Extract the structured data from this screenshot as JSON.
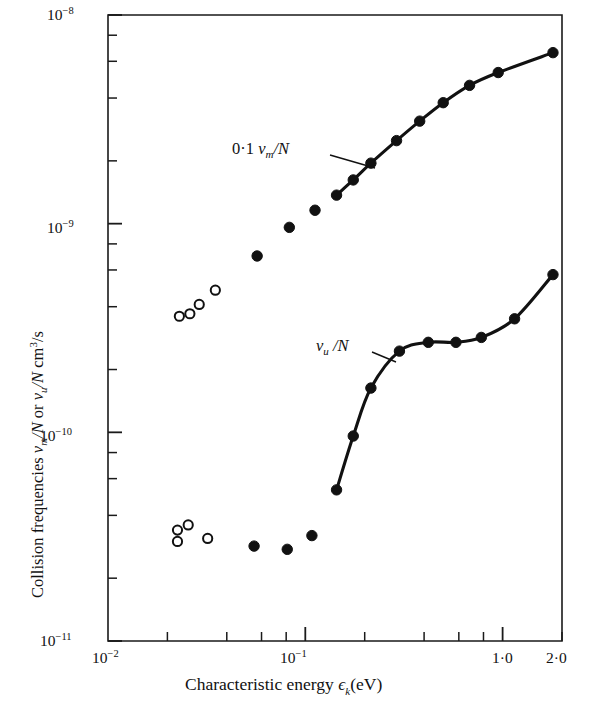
{
  "chart_data": {
    "type": "scatter",
    "title": "",
    "xlabel": "Characteristic energy ϵₖ(eV)",
    "ylabel": "Collision frequencies νₘ/N or νᵤ/N cm³/s",
    "xscale": "log",
    "yscale": "log",
    "xlim": [
      0.01,
      2.0
    ],
    "ylim": [
      1e-11,
      1e-08
    ],
    "grid": false,
    "legend_position": "inline-annotations",
    "x_tick_labels": [
      "10⁻²",
      "10⁻¹",
      "1·0",
      "2·0"
    ],
    "x_tick_values": [
      0.01,
      0.1,
      1.0,
      2.0
    ],
    "y_tick_labels": [
      "10⁻¸",
      "10⁻⁹",
      "10⁻¹⁰",
      "10⁻¹¹"
    ],
    "y_tick_values": [
      1e-08,
      1e-09,
      1e-10,
      1e-11
    ],
    "x_minor_ticks": [
      0.02,
      0.04,
      0.06,
      0.08,
      0.2,
      0.4,
      0.6,
      0.8,
      2.0
    ],
    "y_minor_ticks_per_decade": [
      2,
      4,
      6,
      8
    ],
    "annotations": [
      {
        "text": "0·1 νₘ/N",
        "prefix": "0·1 ",
        "symbol": "ν",
        "subscript": "m",
        "suffix": "/N",
        "x_px": 232,
        "y_px": 152,
        "leader_from": [
          330,
          155
        ],
        "leader_to": [
          375,
          168
        ]
      },
      {
        "text": "νᵤ /N",
        "prefix": "",
        "symbol": "ν",
        "subscript": "u",
        "suffix": " /N",
        "x_px": 316,
        "y_px": 348,
        "leader_from": [
          372,
          352
        ],
        "leader_to": [
          396,
          362
        ]
      }
    ],
    "series": [
      {
        "name": "0·1 νₘ/N (open circles)",
        "marker": "open-circle",
        "line": false,
        "points": [
          {
            "x": 0.023,
            "y": 3.6e-10
          },
          {
            "x": 0.026,
            "y": 3.7e-10
          },
          {
            "x": 0.029,
            "y": 4.1e-10
          },
          {
            "x": 0.035,
            "y": 4.8e-10
          }
        ]
      },
      {
        "name": "0·1 νₘ/N (filled, no line)",
        "marker": "filled-circle",
        "line": false,
        "points": [
          {
            "x": 0.057,
            "y": 7e-10
          },
          {
            "x": 0.083,
            "y": 9.6e-10
          },
          {
            "x": 0.112,
            "y": 1.16e-09
          }
        ]
      },
      {
        "name": "0·1 νₘ/N (curve)",
        "marker": "filled-circle",
        "line": true,
        "points": [
          {
            "x": 0.144,
            "y": 1.37e-09
          },
          {
            "x": 0.175,
            "y": 1.62e-09
          },
          {
            "x": 0.215,
            "y": 1.95e-09
          },
          {
            "x": 0.29,
            "y": 2.5e-09
          },
          {
            "x": 0.38,
            "y": 3.1e-09
          },
          {
            "x": 0.5,
            "y": 3.8e-09
          },
          {
            "x": 0.68,
            "y": 4.6e-09
          },
          {
            "x": 0.95,
            "y": 5.3e-09
          },
          {
            "x": 1.8,
            "y": 6.6e-09
          }
        ]
      },
      {
        "name": "νᵤ/N (open circles)",
        "marker": "open-circle",
        "line": false,
        "points": [
          {
            "x": 0.0225,
            "y": 3.4e-11
          },
          {
            "x": 0.0255,
            "y": 3.6e-11
          },
          {
            "x": 0.0225,
            "y": 3e-11
          },
          {
            "x": 0.032,
            "y": 3.1e-11
          }
        ]
      },
      {
        "name": "νᵤ/N (filled, no line)",
        "marker": "filled-circle",
        "line": false,
        "points": [
          {
            "x": 0.055,
            "y": 2.85e-11
          },
          {
            "x": 0.081,
            "y": 2.75e-11
          },
          {
            "x": 0.108,
            "y": 3.2e-11
          }
        ]
      },
      {
        "name": "νᵤ/N (curve)",
        "marker": "filled-circle",
        "line": true,
        "points": [
          {
            "x": 0.144,
            "y": 5.3e-11
          },
          {
            "x": 0.175,
            "y": 9.6e-11
          },
          {
            "x": 0.215,
            "y": 1.63e-10
          },
          {
            "x": 0.3,
            "y": 2.45e-10
          },
          {
            "x": 0.42,
            "y": 2.7e-10
          },
          {
            "x": 0.58,
            "y": 2.7e-10
          },
          {
            "x": 0.78,
            "y": 2.85e-10
          },
          {
            "x": 1.15,
            "y": 3.5e-10
          },
          {
            "x": 1.8,
            "y": 5.7e-10
          }
        ]
      }
    ]
  },
  "axes": {
    "x_title": "Characteristic energy",
    "x_symbol": "ϵ",
    "x_sub": "k",
    "x_units": "(eV)",
    "y_title_part1": "Collision frequencies",
    "y_symbol1": "ν",
    "y_sub1": "m",
    "y_mid": "/N or",
    "y_symbol2": "ν",
    "y_sub2": "u",
    "y_tail": "/N cm",
    "y_sup": "3",
    "y_tail2": "/s"
  },
  "ticks": {
    "y": [
      {
        "label_mantissa": "10",
        "label_exp": "−8"
      },
      {
        "label_mantissa": "10",
        "label_exp": "−9"
      },
      {
        "label_mantissa": "10",
        "label_exp": "−10"
      },
      {
        "label_mantissa": "10",
        "label_exp": "−11"
      }
    ],
    "x": [
      {
        "label_mantissa": "10",
        "label_exp": "−2"
      },
      {
        "label_mantissa": "10",
        "label_exp": "−1"
      },
      {
        "label_plain": "1·0"
      },
      {
        "label_plain": "2·0"
      }
    ]
  },
  "colors": {
    "ink": "#111111",
    "background": "#ffffff"
  }
}
